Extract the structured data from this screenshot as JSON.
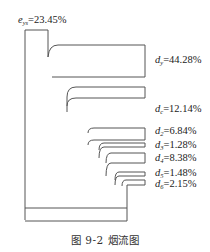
{
  "figure": {
    "caption": "图 9-2  烟流图",
    "input_label": {
      "symbol": "e",
      "subscript": "ys",
      "value": "=23.45%"
    },
    "branches": [
      {
        "symbol": "d",
        "subscript": "y",
        "value": "=44.28%"
      },
      {
        "symbol": "d",
        "subscript": "c",
        "value": "=12.14%"
      },
      {
        "symbol": "d",
        "subscript": "2",
        "value": "=6.84%"
      },
      {
        "symbol": "d",
        "subscript": "3",
        "value": "=1.28%"
      },
      {
        "symbol": "d",
        "subscript": "4",
        "value": "=8.38%"
      },
      {
        "symbol": "d",
        "subscript": "5",
        "value": "=1.48%"
      },
      {
        "symbol": "d",
        "subscript": "6",
        "value": "=2.15%"
      }
    ],
    "line_color": "#555555"
  }
}
